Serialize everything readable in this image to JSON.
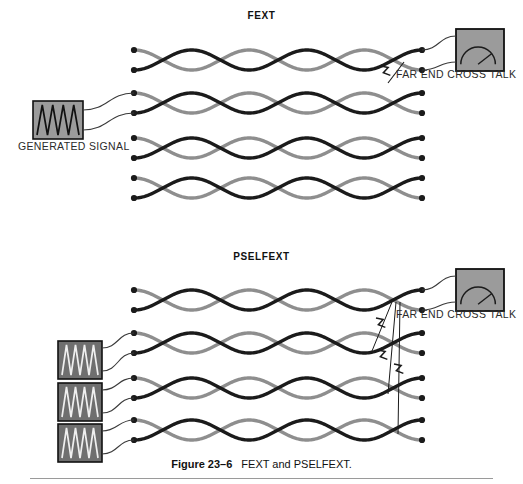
{
  "figure": {
    "caption_number": "Figure 23–6",
    "caption_text": "FEXT and PSELFEXT."
  },
  "sections": {
    "fext": {
      "title": "FEXT",
      "generator_label": "GENERATED SIGNAL",
      "crosstalk_label": "FAR END CROSS TALK",
      "generator_count": 1,
      "meter_count": 1,
      "cable_pairs": 4,
      "crosstalk_arrows": 1,
      "driven_pair_index": 2,
      "measured_pair_index": 1
    },
    "pselfext": {
      "title": "PSELFEXT",
      "crosstalk_label": "FAR END CROSS TALK",
      "generator_count": 3,
      "meter_count": 1,
      "cable_pairs": 4,
      "crosstalk_arrows": 3,
      "driven_pair_indices": [
        2,
        3,
        4
      ],
      "measured_pair_index": 1
    }
  },
  "icons": {
    "generator": "sawtooth-waveform-icon",
    "meter": "analog-gauge-meter-icon",
    "crosstalk": "lightning-bolt-icon",
    "terminal": "terminal-dot-icon",
    "cable": "twisted-pair-cable-icon"
  },
  "colors": {
    "wire_dark": "#1b1b1b",
    "wire_light": "#8e8e8e",
    "generator_box_fill_fext": "#9b9b9b",
    "generator_box_fill_pselfext": "#6f6f6f",
    "meter_box_fill": "#9b9b9b",
    "box_stroke": "#111111",
    "lead_wire": "#3a3a3a",
    "text": "#1a1a1a",
    "rule": "#9a9a9a",
    "background": "#ffffff"
  },
  "geometry": {
    "cable_x_start": 134,
    "cable_x_end": 422,
    "fext_rows": [
      {
        "top": 50,
        "bottom": 70
      },
      {
        "top": 93,
        "bottom": 113
      },
      {
        "top": 138,
        "bottom": 158
      },
      {
        "top": 178,
        "bottom": 198
      }
    ],
    "pselfext_rows": [
      {
        "top": 290,
        "bottom": 310
      },
      {
        "top": 333,
        "bottom": 353
      },
      {
        "top": 378,
        "bottom": 398
      },
      {
        "top": 420,
        "bottom": 440
      }
    ],
    "twist_crossings": 5
  }
}
